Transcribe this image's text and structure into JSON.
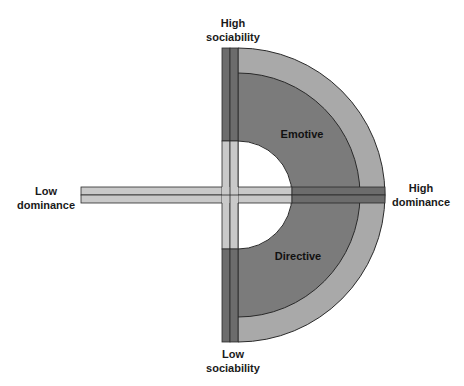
{
  "diagram": {
    "axes": {
      "top": [
        "High",
        "sociability"
      ],
      "bottom": [
        "Low",
        "sociability"
      ],
      "left": [
        "Low",
        "dominance"
      ],
      "right": [
        "High",
        "dominance"
      ]
    },
    "zones": {
      "upper": "Emotive",
      "lower": "Directive"
    },
    "colors": {
      "outer_ring": "#a9a9a9",
      "inner_ring": "#7b7b7b",
      "dark_bar": "#6c6c6c",
      "light_bar": "#c9c9c9",
      "stroke": "#2a2a2a",
      "center": "#ffffff"
    }
  }
}
